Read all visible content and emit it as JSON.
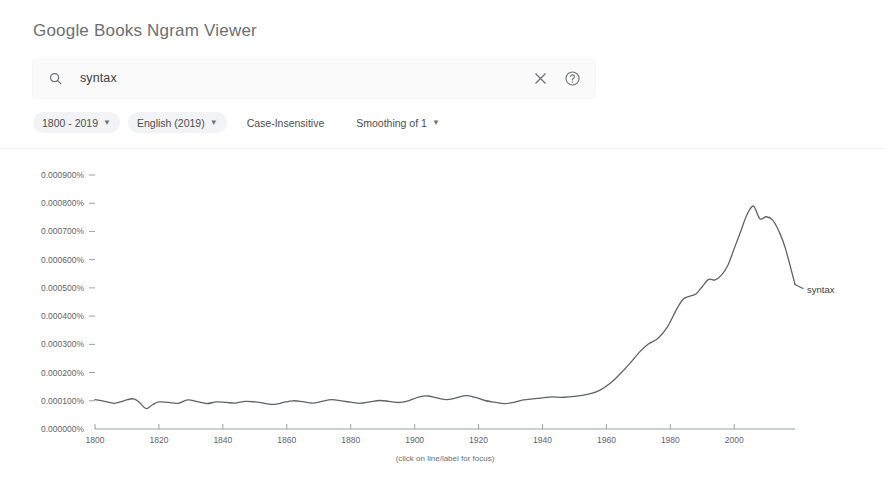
{
  "header": {
    "title": "Google Books Ngram Viewer"
  },
  "search": {
    "value": "syntax",
    "placeholder": "",
    "search_icon": "search-icon",
    "clear_icon": "close-icon",
    "help_icon": "help-icon"
  },
  "filters": [
    {
      "label": "1800 - 2019",
      "has_caret": true,
      "style": "chip"
    },
    {
      "label": "English (2019)",
      "has_caret": true,
      "style": "chip"
    },
    {
      "label": "Case-Insensitive",
      "has_caret": false,
      "style": "plain"
    },
    {
      "label": "Smoothing of 1",
      "has_caret": true,
      "style": "plain"
    }
  ],
  "footnote": "(click on line/label for focus)",
  "chart_data": {
    "type": "line",
    "title": "",
    "xlabel": "",
    "ylabel": "",
    "xlim": [
      1800,
      2019
    ],
    "ylim": [
      0.0,
      0.0009
    ],
    "grid": false,
    "legend_position": "right-inline",
    "line_color": "#5f6368",
    "ytick_labels": [
      "0.000900%",
      "0.000800%",
      "0.000700%",
      "0.000600%",
      "0.000500%",
      "0.000400%",
      "0.000300%",
      "0.000200%",
      "0.000100%",
      "0.000000%"
    ],
    "ytick_values": [
      0.0009,
      0.0008,
      0.0007,
      0.0006,
      0.0005,
      0.0004,
      0.0003,
      0.0002,
      0.0001,
      0.0
    ],
    "xtick_labels": [
      "1800",
      "1820",
      "1840",
      "1860",
      "1880",
      "1900",
      "1920",
      "1940",
      "1960",
      "1980",
      "2000"
    ],
    "xtick_values": [
      1800,
      1820,
      1840,
      1860,
      1880,
      1900,
      1920,
      1940,
      1960,
      1980,
      2000
    ],
    "series": [
      {
        "name": "syntax",
        "x": [
          1800,
          1803,
          1806,
          1809,
          1812,
          1814,
          1816,
          1818,
          1820,
          1823,
          1826,
          1829,
          1832,
          1835,
          1838,
          1841,
          1844,
          1847,
          1850,
          1853,
          1856,
          1859,
          1862,
          1865,
          1868,
          1871,
          1874,
          1877,
          1880,
          1883,
          1886,
          1889,
          1892,
          1895,
          1898,
          1901,
          1904,
          1907,
          1910,
          1913,
          1916,
          1919,
          1922,
          1925,
          1928,
          1931,
          1934,
          1937,
          1940,
          1943,
          1946,
          1949,
          1952,
          1955,
          1958,
          1961,
          1964,
          1967,
          1970,
          1973,
          1976,
          1979,
          1982,
          1984,
          1986,
          1988,
          1990,
          1992,
          1994,
          1996,
          1998,
          2000,
          2002,
          2004,
          2006,
          2008,
          2010,
          2012,
          2014,
          2016,
          2019
        ],
        "y": [
          0.000104,
          9.8e-05,
          9.1e-05,
          0.0001,
          0.000107,
          9.3e-05,
          7.2e-05,
          8.6e-05,
          9.6e-05,
          9.4e-05,
          9.1e-05,
          0.000103,
          9.7e-05,
          9e-05,
          9.6e-05,
          9.4e-05,
          9.2e-05,
          9.8e-05,
          9.6e-05,
          9.1e-05,
          8.7e-05,
          9.4e-05,
          0.0001,
          9.7e-05,
          9.2e-05,
          9.8e-05,
          0.000104,
          0.0001,
          9.5e-05,
          9.1e-05,
          9.6e-05,
          0.000101,
          9.8e-05,
          9.4e-05,
          0.0001,
          0.000112,
          0.000117,
          0.00011,
          0.000104,
          0.00011,
          0.000118,
          0.000112,
          0.000101,
          9.5e-05,
          9e-05,
          9.4e-05,
          0.000103,
          0.000107,
          0.00011,
          0.000114,
          0.000112,
          0.000115,
          0.000118,
          0.000125,
          0.000138,
          0.00016,
          0.000192,
          0.000228,
          0.000268,
          0.0003,
          0.00032,
          0.00036,
          0.000425,
          0.00046,
          0.00047,
          0.000478,
          0.000505,
          0.00053,
          0.000528,
          0.000545,
          0.00058,
          0.00064,
          0.0007,
          0.00076,
          0.00079,
          0.000745,
          0.000752,
          0.00074,
          0.0007,
          0.00064,
          0.000512
        ]
      }
    ]
  }
}
